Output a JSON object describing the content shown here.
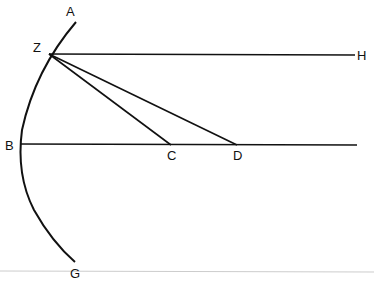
{
  "diagram": {
    "type": "geometric-figure",
    "labels": {
      "A": "A",
      "Z": "Z",
      "H": "H",
      "B": "B",
      "C": "C",
      "D": "D",
      "G": "G"
    },
    "points": {
      "A": [
        76,
        22
      ],
      "Z": [
        49,
        54
      ],
      "H": [
        355,
        55
      ],
      "B": [
        20,
        144
      ],
      "C": [
        171,
        145
      ],
      "D": [
        237,
        145
      ],
      "G": [
        75,
        262
      ]
    },
    "elements": [
      {
        "kind": "arc",
        "through": [
          "A",
          "Z",
          "B",
          "G"
        ]
      },
      {
        "kind": "segment",
        "from": "Z",
        "to": "H"
      },
      {
        "kind": "segment",
        "from": "Z",
        "to": "C"
      },
      {
        "kind": "segment",
        "from": "Z",
        "to": "D"
      },
      {
        "kind": "segment",
        "from": "B",
        "to": "D",
        "extends_past": true
      }
    ],
    "colors": {
      "stroke": "#111111",
      "divider": "#cccccc"
    }
  }
}
